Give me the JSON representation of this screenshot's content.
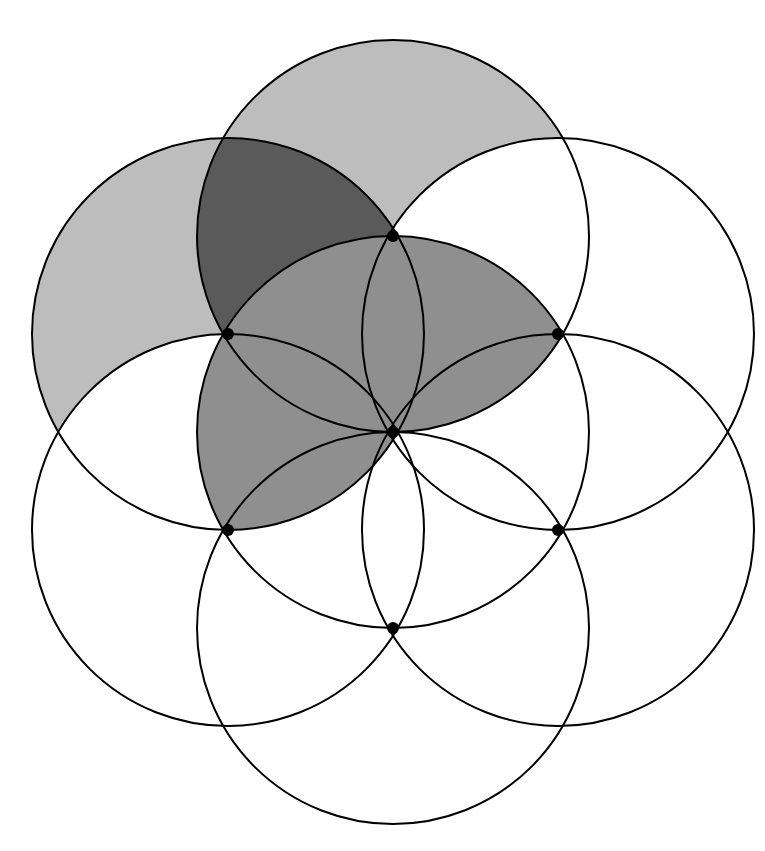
{
  "radius": 196,
  "colors": {
    "stroke": "#000000",
    "light_shade": "#bdbdbd",
    "medium_shade": "#8f8f8f",
    "dark_shade": "#5a5a5a",
    "background": "#ffffff"
  },
  "circles": [
    {
      "id": "center",
      "cx": 393,
      "cy": 432
    },
    {
      "id": "top",
      "cx": 393,
      "cy": 236
    },
    {
      "id": "upper-right",
      "cx": 558,
      "cy": 334
    },
    {
      "id": "lower-right",
      "cx": 558,
      "cy": 530
    },
    {
      "id": "bottom",
      "cx": 393,
      "cy": 628
    },
    {
      "id": "lower-left",
      "cx": 228,
      "cy": 530
    },
    {
      "id": "upper-left",
      "cx": 228,
      "cy": 334
    }
  ],
  "points": [
    {
      "x": 393,
      "y": 236
    },
    {
      "x": 558,
      "y": 334
    },
    {
      "x": 228,
      "y": 334
    },
    {
      "x": 393,
      "y": 432
    },
    {
      "x": 228,
      "y": 530
    },
    {
      "x": 558,
      "y": 530
    },
    {
      "x": 393,
      "y": 628
    }
  ],
  "shaded_regions": [
    {
      "name": "top-circle-light",
      "shade": "light"
    },
    {
      "name": "upper-left-circle-light",
      "shade": "light"
    },
    {
      "name": "top-upper-left-overlap",
      "shade": "dark"
    },
    {
      "name": "top-center-lens",
      "shade": "medium"
    },
    {
      "name": "upper-left-center-lens",
      "shade": "medium"
    }
  ]
}
